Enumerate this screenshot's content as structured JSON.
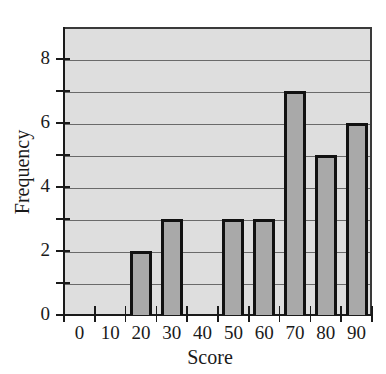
{
  "chart_data": {
    "type": "bar",
    "title": "",
    "xlabel": "Score",
    "ylabel": "Frequency",
    "categories": [
      "0",
      "10",
      "20",
      "30",
      "40",
      "50",
      "60",
      "70",
      "80",
      "90"
    ],
    "values": [
      0,
      0,
      2,
      3,
      0,
      3,
      3,
      7,
      5,
      6
    ],
    "ylim": [
      0,
      9
    ],
    "y_ticks": [
      0,
      2,
      4,
      6,
      8
    ],
    "y_minor_ticks": [
      1,
      3,
      5,
      7
    ],
    "grid": true,
    "legend": null
  },
  "colors": {
    "plot_background": "#dedede",
    "bar_fill": "#a9a9a9",
    "bar_edge": "#111111",
    "gridline": "#6a6a6a"
  }
}
